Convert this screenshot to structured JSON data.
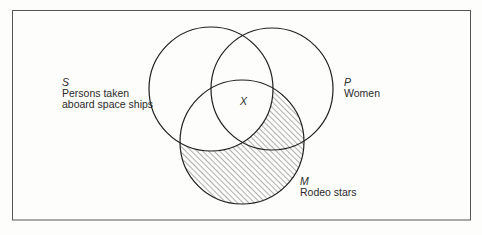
{
  "diagram": {
    "type": "venn",
    "sets": [
      {
        "id": "S",
        "letter": "S",
        "label_lines": [
          "Persons taken",
          "aboard space ships"
        ]
      },
      {
        "id": "P",
        "letter": "P",
        "label_lines": [
          "Women"
        ]
      },
      {
        "id": "M",
        "letter": "M",
        "label_lines": [
          "Rodeo stars"
        ]
      }
    ],
    "marker": {
      "symbol": "X",
      "region": "S∩P∩M"
    },
    "shaded_region": "M − S",
    "colors": {
      "stroke": "#1e1e1e",
      "hatch": "#3a3a3a",
      "frame": "#555555"
    }
  }
}
